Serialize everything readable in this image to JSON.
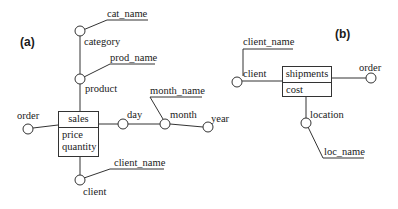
{
  "diagram_a": {
    "panel_label": "(a)",
    "fact": {
      "name": "sales",
      "measures": [
        "price",
        "quantity"
      ]
    },
    "dimensions": {
      "order": "order",
      "product": "product",
      "prod_name": "prod_name",
      "category": "category",
      "cat_name": "cat_name",
      "day": "day",
      "month": "month",
      "month_name": "month_name",
      "year": "year",
      "client": "client",
      "client_name": "client_name"
    }
  },
  "diagram_b": {
    "panel_label": "(b)",
    "fact": {
      "name": "shipments",
      "measures": [
        "cost"
      ]
    },
    "dimensions": {
      "client": "client",
      "client_name": "client_name",
      "order": "order",
      "location": "location",
      "loc_name": "loc_name"
    }
  },
  "colors": {
    "line": "#333333",
    "text": "#1a1a1a",
    "background": "#ffffff"
  }
}
